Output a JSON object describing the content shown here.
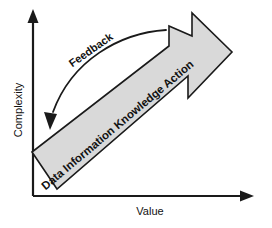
{
  "diagram": {
    "type": "arrow-progression",
    "background_color": "#ffffff",
    "stroke_color": "#1a1a1a",
    "arrow_fill_color": "#d9d9d9"
  },
  "axes": {
    "y": {
      "label": "Complexity",
      "orientation": "vertical",
      "arrowhead": "up",
      "icon": "axis-arrow-up-icon"
    },
    "x": {
      "label": "Value",
      "orientation": "horizontal",
      "arrowhead": "right",
      "icon": "axis-arrow-right-icon"
    }
  },
  "main_arrow": {
    "direction": "up-right",
    "stages": [
      {
        "label": "Data"
      },
      {
        "label": "Information"
      },
      {
        "label": "Knowledge"
      },
      {
        "label": "Action"
      }
    ],
    "stages_text": "Data  Information  Knowledge  Action"
  },
  "feedback": {
    "label": "Feedback",
    "direction": "down-left",
    "icon": "feedback-curve-arrow-icon"
  }
}
